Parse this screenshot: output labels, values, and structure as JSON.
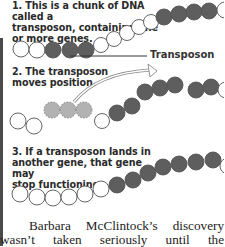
{
  "figure": {
    "step1": {
      "lines": [
        "1. This is a chunk of DNA called a",
        "transposon, containing one",
        "or more genes."
      ]
    },
    "step2": {
      "lines": [
        "2. The transposon",
        "moves position."
      ]
    },
    "step3": {
      "lines": [
        "3. If a transposon lands in",
        "another gene, that gene may",
        "stop functioning."
      ]
    },
    "transposon_label": "Transposon",
    "colors": {
      "gene_fill": "#5e5e5e",
      "empty_fill": "#ffffff",
      "ghost_fill": "#b2b2b2",
      "outline": "#555555"
    }
  },
  "body": {
    "paragraph": "Barbara McClintock’s discovery wasn’t taken seriously until the"
  }
}
